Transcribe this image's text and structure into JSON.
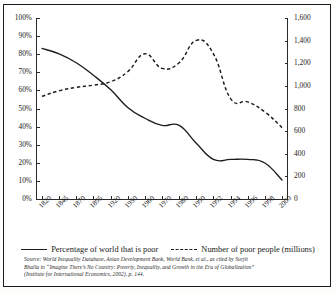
{
  "chart_data": {
    "type": "line",
    "title": "",
    "xlabel": "",
    "ylabel": "",
    "grid": false,
    "legend_position": "bottom",
    "x": [
      "1820",
      "1845",
      "1870",
      "1895",
      "1920",
      "1950",
      "1960",
      "1970",
      "1980",
      "1990",
      "1992",
      "1994",
      "1996",
      "1998",
      "2000"
    ],
    "y_left": {
      "label": "",
      "ticks": [
        "0%",
        "10%",
        "20%",
        "30%",
        "40%",
        "50%",
        "60%",
        "70%",
        "80%",
        "90%",
        "100%"
      ],
      "min": 0,
      "max": 100,
      "step": 10,
      "unit": "%"
    },
    "y_right": {
      "label": "",
      "ticks": [
        "0",
        "200",
        "400",
        "600",
        "800",
        "1,000",
        "1,200",
        "1,400",
        "1,600"
      ],
      "min": 0,
      "max": 1600,
      "step": 200,
      "unit": "millions"
    },
    "series": [
      {
        "name": "Percentage of world that is poor",
        "axis": "left",
        "style": "solid",
        "color": "#1c1c1c",
        "values": [
          83,
          80,
          75,
          68,
          60,
          50,
          44,
          40,
          40,
          30,
          21,
          21,
          21,
          19,
          9.5
        ]
      },
      {
        "name": "Number of poor people (millions)",
        "axis": "right",
        "style": "dashed",
        "color": "#1c1c1c",
        "values": [
          900,
          950,
          980,
          1000,
          1030,
          1120,
          1280,
          1150,
          1200,
          1400,
          1280,
          880,
          850,
          760,
          620
        ]
      }
    ]
  },
  "legend": {
    "items": [
      {
        "marker": "solid-line-icon",
        "label": "Percentage of world that is poor"
      },
      {
        "marker": "dashed-line-icon",
        "label": "Number of poor people (millions)"
      }
    ]
  },
  "source_note": {
    "line1": "Source: World Inequality Database, Asian Development Bank, World Bank, et al., as cited by Surjit",
    "line2": "Bhalla in “Imagine There’s No Country: Poverty, Inequality, and Growth in the Era of Globalization”",
    "line3": "(Institute for International Economics, 2002), p. 144."
  }
}
